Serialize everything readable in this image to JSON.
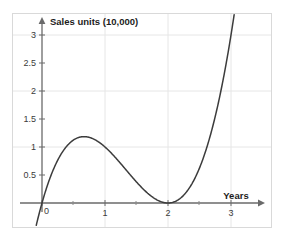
{
  "chart_data": {
    "type": "line",
    "title": "",
    "subtitle": "",
    "ylabel": "Sales units (10,000)",
    "xlabel": "Years",
    "xlim": [
      -0.18,
      3.22
    ],
    "ylim": [
      -0.22,
      3.22
    ],
    "grid": true,
    "legend": null,
    "legend_position": "none",
    "x_ticks_major": [
      0,
      1,
      2,
      3
    ],
    "x_tick_labels": [
      "0",
      "1",
      "2",
      "3"
    ],
    "x_ticks_minor": [
      0.5,
      1.5,
      2.5
    ],
    "y_ticks_major": [
      0.5,
      1,
      1.5,
      2,
      2.5,
      3
    ],
    "y_tick_labels": [
      "0.5",
      "1",
      "1.5",
      "2",
      "2.5",
      "3"
    ],
    "series": [
      {
        "name": "Sales curve",
        "equation": "y = x(x-2)^2",
        "color": "#3c3c3c",
        "x": [
          -0.08,
          0.0,
          0.1,
          0.2,
          0.3,
          0.4,
          0.5,
          0.6,
          0.667,
          0.7,
          0.8,
          0.9,
          1.0,
          1.1,
          1.2,
          1.3,
          1.4,
          1.5,
          1.6,
          1.7,
          1.8,
          1.9,
          2.0,
          2.1,
          2.2,
          2.3,
          2.4,
          2.5,
          2.6,
          2.7,
          2.8,
          2.9,
          3.0,
          3.05
        ],
        "y": [
          -0.35,
          0.0,
          0.361,
          0.648,
          0.867,
          1.024,
          1.125,
          1.176,
          1.185,
          1.183,
          1.152,
          1.089,
          1.0,
          0.891,
          0.768,
          0.637,
          0.504,
          0.375,
          0.256,
          0.153,
          0.072,
          0.019,
          0.0,
          0.021,
          0.088,
          0.207,
          0.384,
          0.625,
          0.936,
          1.323,
          1.792,
          2.349,
          3.0,
          3.36
        ]
      }
    ],
    "annotations": [
      {
        "label": "local maximum",
        "x": 0.667,
        "y": 1.185
      },
      {
        "label": "local minimum",
        "x": 2.0,
        "y": 0.0
      }
    ]
  },
  "axes": {
    "y_axis_title": "Sales units (10,000)",
    "x_axis_title": "Years"
  },
  "colors": {
    "curve": "#3c3c3c",
    "axis": "#6a6a6a",
    "grid": "#e2e2e2",
    "border": "#d9d9d9",
    "tick_text": "#3a3a3a",
    "background": "#ffffff"
  }
}
